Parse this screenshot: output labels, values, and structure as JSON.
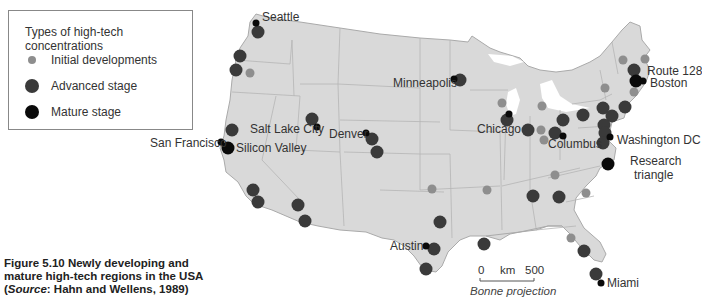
{
  "legend": {
    "title": "Types of high-tech concentrations",
    "items": [
      {
        "label": "Initial developments",
        "color": "#8e8e8e",
        "size": 8
      },
      {
        "label": "Advanced stage",
        "color": "#3a3a3a",
        "size": 14
      },
      {
        "label": "Mature stage",
        "color": "#0a0a0a",
        "size": 14
      }
    ]
  },
  "labels": {
    "seattle": "Seattle",
    "minneapolis": "Minneapolis",
    "route128": "Route 128",
    "boston": "Boston",
    "salt_lake_city": "Salt Lake City",
    "denver": "Denver",
    "san_francisco": "San Francisco",
    "silicon_valley": "Silicon Valley",
    "chicago": "Chicago",
    "columbus": "Columbus",
    "washington_dc": "Washington DC",
    "research_triangle_1": "Research",
    "research_triangle_2": "triangle",
    "austin": "Austin",
    "miami": "Miami"
  },
  "scale": {
    "zero": "0",
    "unit": "km",
    "max": "500"
  },
  "projection": "Bonne projection",
  "caption": {
    "line1": "Figure 5.10 Newly developing and",
    "line2": "mature high-tech regions in the USA",
    "line3_prefix": "(",
    "line3_source": "Source",
    "line3_rest": ": Hahn and Wellens, 1989)"
  },
  "colors": {
    "land": "#d9d9d9",
    "border": "#b0b0b0",
    "initial": "#8e8e8e",
    "advanced": "#3a3a3a",
    "mature": "#0a0a0a"
  }
}
